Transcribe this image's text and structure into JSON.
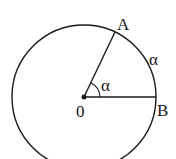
{
  "diagram": {
    "type": "circle-central-angle",
    "center": {
      "label": "0",
      "x": 84,
      "y": 97
    },
    "radius": 72,
    "points": [
      {
        "label": "A",
        "x": 115,
        "y": 32
      },
      {
        "label": "B",
        "x": 156,
        "y": 97
      }
    ],
    "angle_label": "α",
    "arc_label": "α",
    "stroke_color": "#1a1a1a"
  }
}
